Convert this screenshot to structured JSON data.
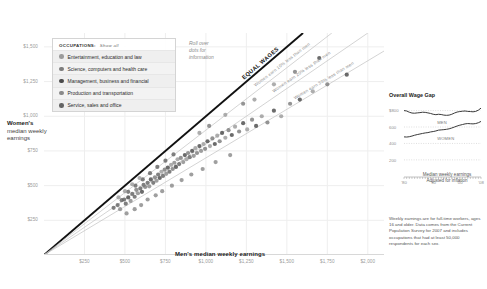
{
  "legend": {
    "title": "OCCUPATIONS:",
    "show_all": "Show all",
    "items": [
      {
        "label": "Entertainment, education and law",
        "color": "#9b9b9b"
      },
      {
        "label": "Science, computers and health care",
        "color": "#7d7d7d"
      },
      {
        "label": "Management, business and financial",
        "color": "#4a4a4a"
      },
      {
        "label": "Production and transportation",
        "color": "#8a8a8a"
      },
      {
        "label": "Service, sales and office",
        "color": "#646464"
      }
    ]
  },
  "hint": "Roll over dots for information",
  "axes": {
    "y_title_bold": "Women's",
    "y_title_rest": "median weekly earnings",
    "x_title": "Men's median weekly earnings",
    "y_ticks": [
      "$1,500",
      "$1,250",
      "$1,000",
      "$750",
      "$500",
      "$250"
    ],
    "x_ticks": [
      "$250",
      "$500",
      "$750",
      "$1,000",
      "$1,250",
      "$1,500",
      "$1,750",
      "$2,000"
    ]
  },
  "reference_lines": [
    {
      "label": "EQUAL WAGES",
      "ratio": 1.0,
      "style": "equal"
    },
    {
      "label": "Women earn 10% less than men",
      "ratio": 0.9,
      "style": "pct"
    },
    {
      "label": "Women earn 20% less than men",
      "ratio": 0.8,
      "style": "pct"
    },
    {
      "label": "Women earn 30% less than men",
      "ratio": 0.7,
      "style": "pct"
    }
  ],
  "side_panel": {
    "title": "Overall Wage Gap",
    "caption_line1": "Median weekly earnings",
    "caption_line2": "Adjusted for inflation",
    "series_labels": {
      "men": "MEN",
      "women": "WOMEN"
    },
    "y_ticks": [
      "$800",
      "600",
      "400",
      "200"
    ],
    "x_ticks": [
      "'80",
      "'90",
      "'00",
      "'08"
    ]
  },
  "footnote": "Weekly earnings are for full-time workers, ages 16 and older. Data comes from the Current Population Survey for 2007 and includes occupations that had at least 50,000 respondents for each sex.",
  "chart_data": {
    "type": "scatter",
    "xlabel": "Men's median weekly earnings",
    "ylabel": "Women's median weekly earnings",
    "xlim": [
      0,
      2100
    ],
    "ylim": [
      0,
      1600
    ],
    "grid": true,
    "legend": "top-left",
    "reference_ratios": [
      1.0,
      0.9,
      0.8,
      0.7
    ],
    "points": [
      {
        "x": 430,
        "y": 340,
        "g": 4
      },
      {
        "x": 455,
        "y": 360,
        "g": 4
      },
      {
        "x": 470,
        "y": 330,
        "g": 3
      },
      {
        "x": 495,
        "y": 400,
        "g": 4
      },
      {
        "x": 505,
        "y": 370,
        "g": 4
      },
      {
        "x": 520,
        "y": 415,
        "g": 2
      },
      {
        "x": 535,
        "y": 390,
        "g": 3
      },
      {
        "x": 545,
        "y": 440,
        "g": 4
      },
      {
        "x": 560,
        "y": 420,
        "g": 4
      },
      {
        "x": 570,
        "y": 470,
        "g": 1
      },
      {
        "x": 580,
        "y": 445,
        "g": 3
      },
      {
        "x": 595,
        "y": 480,
        "g": 4
      },
      {
        "x": 605,
        "y": 455,
        "g": 2
      },
      {
        "x": 615,
        "y": 505,
        "g": 4
      },
      {
        "x": 625,
        "y": 490,
        "g": 1
      },
      {
        "x": 640,
        "y": 520,
        "g": 4
      },
      {
        "x": 650,
        "y": 495,
        "g": 3
      },
      {
        "x": 660,
        "y": 545,
        "g": 2
      },
      {
        "x": 675,
        "y": 520,
        "g": 4
      },
      {
        "x": 685,
        "y": 560,
        "g": 1
      },
      {
        "x": 695,
        "y": 535,
        "g": 3
      },
      {
        "x": 705,
        "y": 580,
        "g": 4
      },
      {
        "x": 715,
        "y": 555,
        "g": 2
      },
      {
        "x": 725,
        "y": 600,
        "g": 0
      },
      {
        "x": 735,
        "y": 570,
        "g": 4
      },
      {
        "x": 745,
        "y": 615,
        "g": 1
      },
      {
        "x": 755,
        "y": 585,
        "g": 3
      },
      {
        "x": 765,
        "y": 630,
        "g": 2
      },
      {
        "x": 775,
        "y": 600,
        "g": 4
      },
      {
        "x": 785,
        "y": 650,
        "g": 0
      },
      {
        "x": 795,
        "y": 620,
        "g": 1
      },
      {
        "x": 805,
        "y": 665,
        "g": 3
      },
      {
        "x": 815,
        "y": 635,
        "g": 2
      },
      {
        "x": 825,
        "y": 690,
        "g": 0
      },
      {
        "x": 835,
        "y": 655,
        "g": 4
      },
      {
        "x": 845,
        "y": 700,
        "g": 1
      },
      {
        "x": 860,
        "y": 670,
        "g": 3
      },
      {
        "x": 870,
        "y": 720,
        "g": 2
      },
      {
        "x": 880,
        "y": 690,
        "g": 0
      },
      {
        "x": 890,
        "y": 735,
        "g": 1
      },
      {
        "x": 900,
        "y": 705,
        "g": 4
      },
      {
        "x": 915,
        "y": 750,
        "g": 2
      },
      {
        "x": 925,
        "y": 715,
        "g": 3
      },
      {
        "x": 935,
        "y": 770,
        "g": 0
      },
      {
        "x": 945,
        "y": 735,
        "g": 1
      },
      {
        "x": 960,
        "y": 785,
        "g": 2
      },
      {
        "x": 970,
        "y": 750,
        "g": 3
      },
      {
        "x": 985,
        "y": 800,
        "g": 0
      },
      {
        "x": 995,
        "y": 765,
        "g": 1
      },
      {
        "x": 1010,
        "y": 820,
        "g": 2
      },
      {
        "x": 1025,
        "y": 785,
        "g": 0
      },
      {
        "x": 1040,
        "y": 840,
        "g": 1
      },
      {
        "x": 1055,
        "y": 800,
        "g": 2
      },
      {
        "x": 1070,
        "y": 860,
        "g": 0
      },
      {
        "x": 1085,
        "y": 820,
        "g": 1
      },
      {
        "x": 1100,
        "y": 880,
        "g": 2
      },
      {
        "x": 1120,
        "y": 845,
        "g": 0
      },
      {
        "x": 1140,
        "y": 900,
        "g": 1
      },
      {
        "x": 1160,
        "y": 865,
        "g": 2
      },
      {
        "x": 1180,
        "y": 925,
        "g": 0
      },
      {
        "x": 1205,
        "y": 890,
        "g": 1
      },
      {
        "x": 1230,
        "y": 950,
        "g": 2
      },
      {
        "x": 1255,
        "y": 905,
        "g": 0
      },
      {
        "x": 1285,
        "y": 975,
        "g": 1
      },
      {
        "x": 1310,
        "y": 930,
        "g": 2
      },
      {
        "x": 1345,
        "y": 1000,
        "g": 0
      },
      {
        "x": 1380,
        "y": 955,
        "g": 1
      },
      {
        "x": 1420,
        "y": 1040,
        "g": 2
      },
      {
        "x": 1465,
        "y": 1000,
        "g": 0
      },
      {
        "x": 1520,
        "y": 1090,
        "g": 1
      },
      {
        "x": 1580,
        "y": 1120,
        "g": 2
      },
      {
        "x": 1660,
        "y": 1180,
        "g": 0
      },
      {
        "x": 1750,
        "y": 1230,
        "g": 1
      },
      {
        "x": 1870,
        "y": 1300,
        "g": 2
      },
      {
        "x": 510,
        "y": 300,
        "g": 3
      },
      {
        "x": 560,
        "y": 330,
        "g": 3
      },
      {
        "x": 600,
        "y": 360,
        "g": 3
      },
      {
        "x": 640,
        "y": 400,
        "g": 3
      },
      {
        "x": 690,
        "y": 430,
        "g": 3
      },
      {
        "x": 730,
        "y": 460,
        "g": 3
      },
      {
        "x": 790,
        "y": 500,
        "g": 3
      },
      {
        "x": 850,
        "y": 540,
        "g": 3
      },
      {
        "x": 910,
        "y": 580,
        "g": 3
      },
      {
        "x": 980,
        "y": 620,
        "g": 3
      },
      {
        "x": 1060,
        "y": 670,
        "g": 3
      },
      {
        "x": 1150,
        "y": 720,
        "g": 3
      },
      {
        "x": 480,
        "y": 395,
        "g": 4
      },
      {
        "x": 520,
        "y": 455,
        "g": 4
      },
      {
        "x": 565,
        "y": 500,
        "g": 4
      },
      {
        "x": 610,
        "y": 545,
        "g": 4
      },
      {
        "x": 655,
        "y": 590,
        "g": 4
      },
      {
        "x": 700,
        "y": 635,
        "g": 4
      },
      {
        "x": 750,
        "y": 680,
        "g": 4
      },
      {
        "x": 800,
        "y": 725,
        "g": 4
      },
      {
        "x": 460,
        "y": 415,
        "g": 0
      },
      {
        "x": 500,
        "y": 460,
        "g": 0
      },
      {
        "x": 545,
        "y": 510,
        "g": 0
      },
      {
        "x": 590,
        "y": 555,
        "g": 0
      },
      {
        "x": 1300,
        "y": 1120,
        "g": 0
      },
      {
        "x": 1420,
        "y": 1230,
        "g": 0
      },
      {
        "x": 1550,
        "y": 1320,
        "g": 1
      },
      {
        "x": 1700,
        "y": 1420,
        "g": 2
      },
      {
        "x": 1120,
        "y": 1010,
        "g": 0
      },
      {
        "x": 1230,
        "y": 1090,
        "g": 1
      },
      {
        "x": 960,
        "y": 880,
        "g": 0
      },
      {
        "x": 1020,
        "y": 930,
        "g": 1
      }
    ],
    "side_chart": {
      "type": "line",
      "title": "Overall Wage Gap",
      "ylim": [
        150,
        880
      ],
      "xlim": [
        1979,
        2008
      ],
      "series": [
        {
          "name": "MEN",
          "values": [
            800,
            795,
            780,
            770,
            768,
            772,
            775,
            780,
            778,
            772,
            765,
            755,
            750,
            755,
            752,
            745,
            742,
            745,
            755,
            770,
            782,
            788,
            792,
            795,
            790,
            788,
            785,
            790,
            805,
            830
          ]
        },
        {
          "name": "WOMEN",
          "values": [
            480,
            478,
            482,
            490,
            500,
            508,
            515,
            522,
            528,
            532,
            540,
            545,
            552,
            562,
            565,
            568,
            572,
            578,
            588,
            600,
            612,
            622,
            630,
            638,
            642,
            640,
            638,
            642,
            652,
            668
          ]
        }
      ]
    }
  }
}
